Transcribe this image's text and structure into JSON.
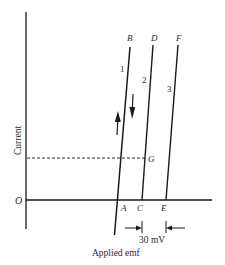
{
  "figure": {
    "y_axis_label": "Current",
    "x_axis_label": "Applied emf",
    "origin_label": "O",
    "points": {
      "A": "A",
      "B": "B",
      "C": "C",
      "D": "D",
      "E": "E",
      "F": "F",
      "G": "G"
    },
    "curve_labels": [
      "1",
      "2",
      "3"
    ],
    "dimension_label": "30 mV",
    "colors": {
      "line": "#1a1a1a",
      "text": "#2a2a2a",
      "background": "#ffffff"
    }
  }
}
